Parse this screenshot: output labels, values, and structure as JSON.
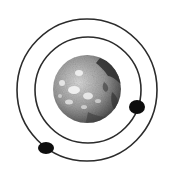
{
  "illustration": {
    "subject": "planet with two orbiting moons",
    "background_color": "#ffffff",
    "planet": {
      "cx": 87,
      "cy": 89,
      "r": 34,
      "base_color": "#9a9a9a",
      "light_color": "#e6e6e6",
      "dark_color": "#2a2a2a"
    },
    "orbits": [
      {
        "name": "outer-orbit",
        "cx": 87,
        "cy": 90,
        "rx": 70,
        "ry": 71,
        "stroke": "#2b2b2b",
        "stroke_width": 1.6
      },
      {
        "name": "inner-orbit",
        "cx": 88,
        "cy": 90,
        "rx": 53,
        "ry": 53,
        "stroke": "#2b2b2b",
        "stroke_width": 1.6
      }
    ],
    "moons": [
      {
        "name": "moon-inner",
        "cx": 137,
        "cy": 107,
        "rx": 8,
        "ry": 7,
        "color": "#0d0d0d"
      },
      {
        "name": "moon-outer",
        "cx": 46,
        "cy": 148,
        "rx": 8,
        "ry": 6,
        "color": "#0d0d0d"
      }
    ]
  }
}
